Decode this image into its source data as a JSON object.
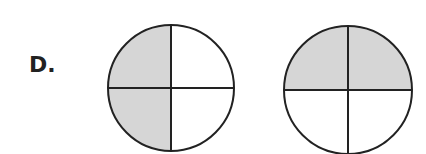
{
  "option": {
    "label": "D.",
    "circles": [
      {
        "name": "circle-left-half-shaded",
        "shaded": "left half"
      },
      {
        "name": "circle-top-half-shaded",
        "shaded": "top half"
      }
    ],
    "colors": {
      "fill": "#d6d6d6",
      "stroke": "#222222"
    }
  }
}
